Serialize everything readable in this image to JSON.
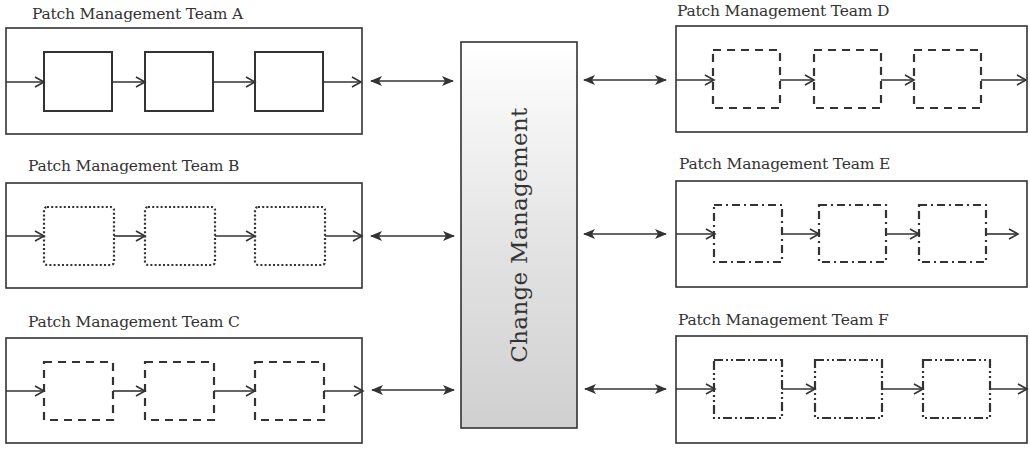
{
  "diagram": {
    "center": {
      "label": "Change Management",
      "fill_top": "#ffffff",
      "fill_bottom": "#d2d2d2",
      "stroke": "#333333"
    },
    "teams": [
      {
        "id": "A",
        "title": "Patch Management Team A",
        "side": "left",
        "step_style": "solid",
        "steps": 3
      },
      {
        "id": "B",
        "title": "Patch Management Team B",
        "side": "left",
        "step_style": "dotted",
        "steps": 3
      },
      {
        "id": "C",
        "title": "Patch Management Team C",
        "side": "left",
        "step_style": "dashed",
        "steps": 3
      },
      {
        "id": "D",
        "title": "Patch Management Team D",
        "side": "right",
        "step_style": "dashed",
        "steps": 3
      },
      {
        "id": "E",
        "title": "Patch Management Team E",
        "side": "right",
        "step_style": "dash-dot",
        "steps": 3
      },
      {
        "id": "F",
        "title": "Patch Management Team F",
        "side": "right",
        "step_style": "dash-dot-dot",
        "steps": 3
      }
    ],
    "connectors": "bidirectional arrows between each team and Change Management",
    "line_color": "#333333"
  }
}
